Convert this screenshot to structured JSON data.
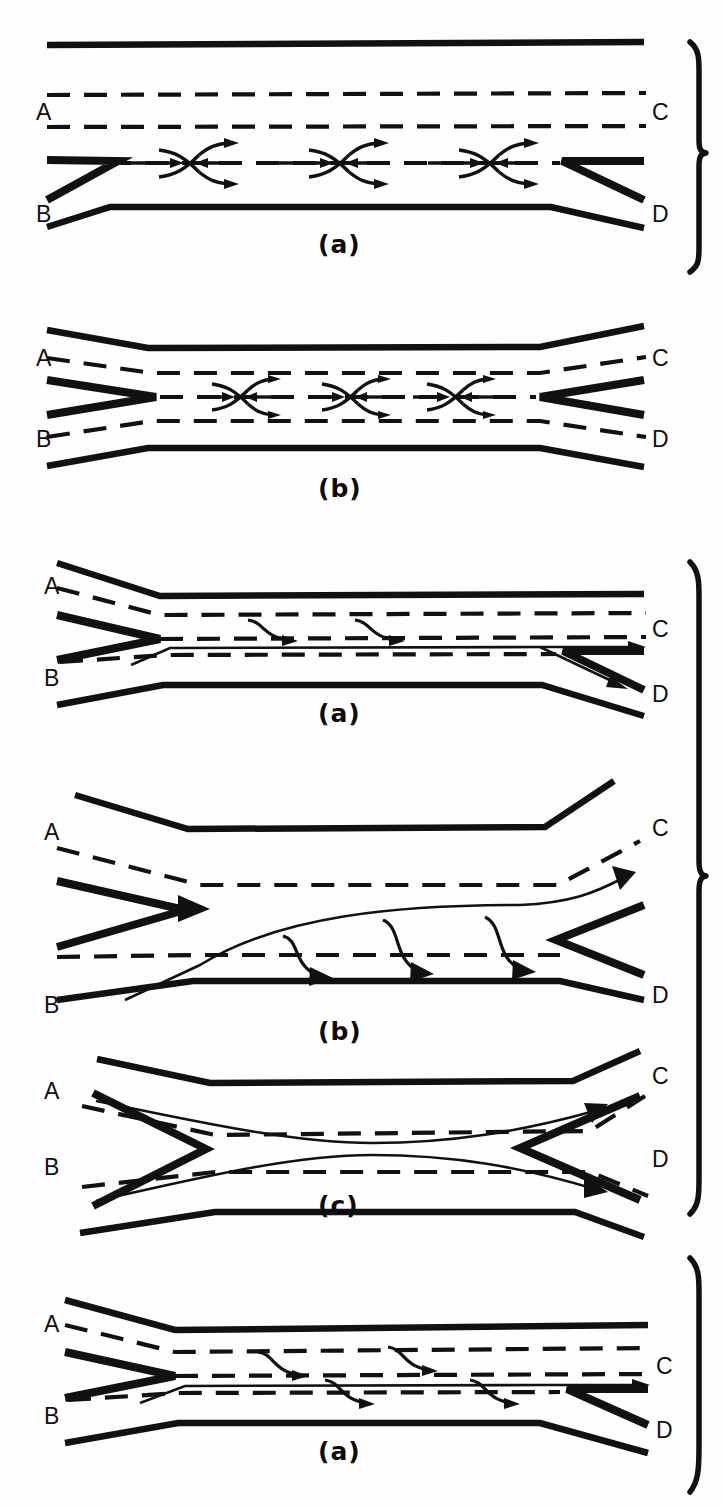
{
  "figure": {
    "background_color": "#fefefe",
    "ink_color": "#111111"
  },
  "labels": {
    "A": "A",
    "B": "B",
    "C": "C",
    "D": "D"
  },
  "groups": [
    {
      "id": "group-1",
      "brace": {
        "top": 38,
        "bottom": 268
      },
      "panels": [
        {
          "id": "panel-1a",
          "caption": "(a)",
          "type": "two-sided-weave",
          "terminals": {
            "left_top": "A",
            "left_bottom": "B",
            "right_top": "C",
            "right_bottom": "D"
          },
          "weave_symbol_count": 3,
          "weave_symbol": "x-cross-arrows"
        },
        {
          "id": "panel-1b",
          "caption": "(b)",
          "type": "two-sided-weave",
          "terminals": {
            "left_top": "A",
            "left_bottom": "B",
            "right_top": "C",
            "right_bottom": "D"
          },
          "weave_symbol_count": 3,
          "weave_symbol": "x-cross-arrows"
        }
      ]
    },
    {
      "id": "group-2",
      "brace": {
        "top": 560,
        "bottom": 1216
      },
      "panels": [
        {
          "id": "panel-2a",
          "caption": "(a)",
          "type": "one-sided-weave",
          "terminals": {
            "left_top": "A",
            "left_bottom": "B",
            "right_top": "C",
            "right_bottom": "D"
          },
          "weave_symbol_count": 2,
          "weave_symbol": "s-curve-arrow"
        },
        {
          "id": "panel-2b",
          "caption": "(b)",
          "type": "one-sided-weave",
          "terminals": {
            "left_top": "A",
            "left_bottom": "B",
            "right_top": "C",
            "right_bottom": "D"
          },
          "weave_symbol_count": 3,
          "weave_symbol": "s-curve-arrow"
        },
        {
          "id": "panel-2c",
          "caption": "(c)",
          "type": "one-sided-weave",
          "terminals": {
            "left_top": "A",
            "left_bottom": "B",
            "right_top": "C",
            "right_bottom": "D"
          },
          "weave_symbol_count": 0,
          "weave_symbol": "none"
        }
      ]
    },
    {
      "id": "group-3",
      "brace": {
        "top": 1256,
        "bottom": 1492
      },
      "panels": [
        {
          "id": "panel-3a",
          "caption": "(a)",
          "type": "one-sided-weave",
          "terminals": {
            "left_top": "A",
            "left_bottom": "B",
            "right_top": "C",
            "right_bottom": "D"
          },
          "weave_symbol_count": 4,
          "weave_symbol": "s-curve-arrow"
        }
      ]
    }
  ],
  "captions": {
    "c1a": "(a)",
    "c1b": "(b)",
    "c2a": "(a)",
    "c2b": "(b)",
    "c2c": "(c)",
    "c3a": "(a)"
  }
}
